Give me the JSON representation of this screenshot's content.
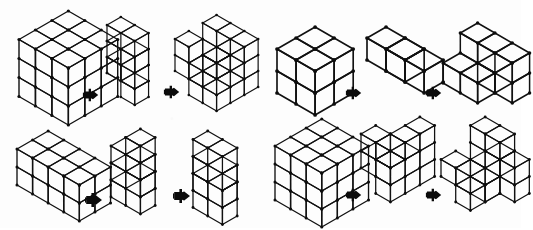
{
  "page": {
    "kind": "line-drawing-worksheet",
    "background_color": "#fdfdfd",
    "ink_color": "#111111",
    "width_px": 521,
    "height_px": 228,
    "layout": "2 rows x 2 columns of problems; each problem shows three isometric cube assemblies separated by two small solid arrow markers",
    "visible_text": ""
  },
  "icons": {
    "arrow_right": "right-arrow-marker",
    "arrow_label": ""
  },
  "problems": [
    {
      "id": "problem-1",
      "position": "top-left",
      "x": 6,
      "y": 4,
      "width": 255,
      "height": 112,
      "stimuli": [
        {
          "id": "p1-s1",
          "role": "whole-cube",
          "name": "solid-3x3x3-cube",
          "dims": [
            3,
            3,
            3
          ],
          "cube_count": 27,
          "x": 16,
          "y": 8,
          "cell": 19,
          "cells": [
            [
              0,
              0,
              0
            ],
            [
              1,
              0,
              0
            ],
            [
              2,
              0,
              0
            ],
            [
              0,
              1,
              0
            ],
            [
              1,
              1,
              0
            ],
            [
              2,
              1,
              0
            ],
            [
              0,
              2,
              0
            ],
            [
              1,
              2,
              0
            ],
            [
              2,
              2,
              0
            ],
            [
              0,
              0,
              1
            ],
            [
              1,
              0,
              1
            ],
            [
              2,
              0,
              1
            ],
            [
              0,
              1,
              1
            ],
            [
              1,
              1,
              1
            ],
            [
              2,
              1,
              1
            ],
            [
              0,
              2,
              1
            ],
            [
              1,
              2,
              1
            ],
            [
              2,
              2,
              1
            ],
            [
              0,
              0,
              2
            ],
            [
              1,
              0,
              2
            ],
            [
              2,
              0,
              2
            ],
            [
              0,
              1,
              2
            ],
            [
              1,
              1,
              2
            ],
            [
              2,
              1,
              2
            ],
            [
              0,
              2,
              2
            ],
            [
              1,
              2,
              2
            ],
            [
              2,
              2,
              2
            ]
          ]
        },
        {
          "id": "p1-s2",
          "role": "piece-a",
          "name": "zigzag-piece",
          "dims": [
            3,
            3,
            2
          ],
          "cube_count": 9,
          "x": 104,
          "y": 14,
          "cell": 16,
          "cells": [
            [
              0,
              2,
              0
            ],
            [
              1,
              2,
              0
            ],
            [
              1,
              2,
              1
            ],
            [
              2,
              2,
              1
            ],
            [
              1,
              1,
              0
            ],
            [
              1,
              1,
              1
            ],
            [
              0,
              0,
              0
            ],
            [
              1,
              0,
              0
            ],
            [
              2,
              0,
              1
            ]
          ]
        },
        {
          "id": "p1-s3",
          "role": "piece-b",
          "name": "notched-block-piece",
          "dims": [
            3,
            3,
            3
          ],
          "cube_count": 18,
          "x": 172,
          "y": 12,
          "cell": 16,
          "cells": [
            [
              0,
              0,
              0
            ],
            [
              1,
              0,
              0
            ],
            [
              2,
              0,
              0
            ],
            [
              0,
              1,
              0
            ],
            [
              2,
              1,
              0
            ],
            [
              0,
              2,
              0
            ],
            [
              1,
              2,
              0
            ],
            [
              2,
              2,
              0
            ],
            [
              0,
              0,
              1
            ],
            [
              2,
              0,
              1
            ],
            [
              1,
              1,
              1
            ],
            [
              2,
              2,
              1
            ],
            [
              1,
              0,
              2
            ],
            [
              2,
              0,
              2
            ],
            [
              0,
              1,
              2
            ],
            [
              2,
              1,
              2
            ],
            [
              0,
              2,
              2
            ],
            [
              2,
              2,
              2
            ]
          ]
        }
      ],
      "arrows": [
        {
          "id": "p1-a1",
          "x": 82,
          "y": 86,
          "size": 18
        },
        {
          "id": "p1-a2",
          "x": 163,
          "y": 83,
          "size": 18
        }
      ]
    },
    {
      "id": "problem-2",
      "position": "top-right",
      "x": 264,
      "y": 12,
      "width": 255,
      "height": 104,
      "stimuli": [
        {
          "id": "p2-s1",
          "role": "whole-cube",
          "name": "solid-2x2x2-block",
          "dims": [
            2,
            2,
            2
          ],
          "cube_count": 8,
          "x": 274,
          "y": 24,
          "cell": 22,
          "cells": [
            [
              0,
              0,
              0
            ],
            [
              1,
              0,
              0
            ],
            [
              0,
              1,
              0
            ],
            [
              1,
              1,
              0
            ],
            [
              0,
              0,
              1
            ],
            [
              1,
              0,
              1
            ],
            [
              0,
              1,
              1
            ],
            [
              1,
              1,
              1
            ]
          ]
        },
        {
          "id": "p2-s2",
          "role": "piece-a",
          "name": "tetromino-t-piece",
          "dims": [
            2,
            2,
            2
          ],
          "cube_count": 4,
          "x": 364,
          "y": 24,
          "cell": 22,
          "cells": [
            [
              0,
              1,
              1
            ],
            [
              0,
              0,
              0
            ],
            [
              1,
              0,
              0
            ],
            [
              1,
              1,
              1
            ]
          ]
        },
        {
          "id": "p2-s3",
          "role": "piece-b",
          "name": "pinwheel-piece",
          "dims": [
            3,
            2,
            2
          ],
          "cube_count": 8,
          "x": 440,
          "y": 20,
          "cell": 20,
          "cells": [
            [
              0,
              1,
              0
            ],
            [
              1,
              1,
              0
            ],
            [
              2,
              1,
              1
            ],
            [
              0,
              0,
              1
            ],
            [
              1,
              0,
              0
            ],
            [
              1,
              0,
              1
            ],
            [
              2,
              0,
              0
            ],
            [
              2,
              1,
              0
            ]
          ]
        }
      ],
      "arrows": [
        {
          "id": "p2-a1",
          "x": 345,
          "y": 84,
          "size": 18
        },
        {
          "id": "p2-a2",
          "x": 425,
          "y": 84,
          "size": 18
        }
      ]
    },
    {
      "id": "problem-3",
      "position": "bottom-left",
      "x": 6,
      "y": 120,
      "width": 255,
      "height": 104,
      "stimuli": [
        {
          "id": "p3-s1",
          "role": "whole-cube",
          "name": "solid-4x2x2-bar",
          "dims": [
            4,
            2,
            2
          ],
          "cube_count": 16,
          "x": 14,
          "y": 128,
          "cell": 18,
          "cells": [
            [
              0,
              0,
              0
            ],
            [
              1,
              0,
              0
            ],
            [
              2,
              0,
              0
            ],
            [
              3,
              0,
              0
            ],
            [
              0,
              1,
              0
            ],
            [
              1,
              1,
              0
            ],
            [
              2,
              1,
              0
            ],
            [
              3,
              1,
              0
            ],
            [
              0,
              0,
              1
            ],
            [
              1,
              0,
              1
            ],
            [
              2,
              0,
              1
            ],
            [
              3,
              0,
              1
            ],
            [
              0,
              1,
              1
            ],
            [
              1,
              1,
              1
            ],
            [
              2,
              1,
              1
            ],
            [
              3,
              1,
              1
            ]
          ]
        },
        {
          "id": "p3-s2",
          "role": "piece-a",
          "name": "staircase-piece",
          "dims": [
            4,
            2,
            3
          ],
          "cube_count": 9,
          "x": 108,
          "y": 126,
          "cell": 17,
          "cells": [
            [
              0,
              0,
              0
            ],
            [
              1,
              0,
              0
            ],
            [
              1,
              1,
              0
            ],
            [
              1,
              0,
              1
            ],
            [
              2,
              0,
              1
            ],
            [
              2,
              1,
              1
            ],
            [
              2,
              0,
              2
            ],
            [
              3,
              0,
              2
            ],
            [
              3,
              1,
              2
            ]
          ]
        },
        {
          "id": "p3-s3",
          "role": "piece-b",
          "name": "stepped-bar-piece",
          "dims": [
            4,
            2,
            3
          ],
          "cube_count": 12,
          "x": 190,
          "y": 128,
          "cell": 17,
          "cells": [
            [
              0,
              0,
              0
            ],
            [
              1,
              0,
              0
            ],
            [
              0,
              1,
              0
            ],
            [
              1,
              1,
              0
            ],
            [
              1,
              0,
              1
            ],
            [
              2,
              0,
              1
            ],
            [
              1,
              1,
              1
            ],
            [
              2,
              1,
              1
            ],
            [
              2,
              0,
              2
            ],
            [
              3,
              0,
              2
            ],
            [
              2,
              1,
              2
            ],
            [
              3,
              1,
              2
            ]
          ]
        }
      ],
      "arrows": [
        {
          "id": "p3-a1",
          "x": 84,
          "y": 190,
          "size": 20
        },
        {
          "id": "p3-a2",
          "x": 172,
          "y": 186,
          "size": 20
        }
      ]
    },
    {
      "id": "problem-4",
      "position": "bottom-right",
      "x": 264,
      "y": 114,
      "width": 255,
      "height": 110,
      "stimuli": [
        {
          "id": "p4-s1",
          "role": "whole-cube",
          "name": "solid-3x3x3-cube",
          "dims": [
            3,
            3,
            3
          ],
          "cube_count": 27,
          "x": 272,
          "y": 116,
          "cell": 18,
          "cells": [
            [
              0,
              0,
              0
            ],
            [
              1,
              0,
              0
            ],
            [
              2,
              0,
              0
            ],
            [
              0,
              1,
              0
            ],
            [
              1,
              1,
              0
            ],
            [
              2,
              1,
              0
            ],
            [
              0,
              2,
              0
            ],
            [
              1,
              2,
              0
            ],
            [
              2,
              2,
              0
            ],
            [
              0,
              0,
              1
            ],
            [
              1,
              0,
              1
            ],
            [
              2,
              0,
              1
            ],
            [
              0,
              1,
              1
            ],
            [
              1,
              1,
              1
            ],
            [
              2,
              1,
              1
            ],
            [
              0,
              2,
              1
            ],
            [
              1,
              2,
              1
            ],
            [
              2,
              2,
              1
            ],
            [
              0,
              0,
              2
            ],
            [
              1,
              0,
              2
            ],
            [
              2,
              0,
              2
            ],
            [
              0,
              1,
              2
            ],
            [
              1,
              1,
              2
            ],
            [
              2,
              1,
              2
            ],
            [
              0,
              2,
              2
            ],
            [
              1,
              2,
              2
            ],
            [
              2,
              2,
              2
            ]
          ]
        },
        {
          "id": "p4-s2",
          "role": "piece-a",
          "name": "corner-step-piece",
          "dims": [
            3,
            3,
            3
          ],
          "cube_count": 13,
          "x": 358,
          "y": 114,
          "cell": 17,
          "cells": [
            [
              0,
              0,
              0
            ],
            [
              1,
              0,
              0
            ],
            [
              2,
              0,
              0
            ],
            [
              2,
              1,
              0
            ],
            [
              2,
              2,
              0
            ],
            [
              1,
              0,
              1
            ],
            [
              2,
              0,
              1
            ],
            [
              2,
              1,
              1
            ],
            [
              2,
              2,
              1
            ],
            [
              0,
              1,
              1
            ],
            [
              1,
              1,
              2
            ],
            [
              2,
              0,
              2
            ],
            [
              2,
              1,
              2
            ]
          ]
        },
        {
          "id": "p4-s3",
          "role": "piece-b",
          "name": "cross-notch-piece",
          "dims": [
            3,
            3,
            3
          ],
          "cube_count": 14,
          "x": 438,
          "y": 114,
          "cell": 17,
          "cells": [
            [
              0,
              2,
              0
            ],
            [
              1,
              2,
              0
            ],
            [
              2,
              2,
              1
            ],
            [
              0,
              1,
              0
            ],
            [
              1,
              1,
              0
            ],
            [
              1,
              1,
              1
            ],
            [
              2,
              1,
              0
            ],
            [
              0,
              0,
              1
            ],
            [
              1,
              0,
              0
            ],
            [
              1,
              0,
              1
            ],
            [
              1,
              0,
              2
            ],
            [
              2,
              0,
              0
            ],
            [
              2,
              1,
              2
            ],
            [
              0,
              1,
              2
            ]
          ]
        }
      ],
      "arrows": [
        {
          "id": "p4-a1",
          "x": 345,
          "y": 186,
          "size": 18
        },
        {
          "id": "p4-a2",
          "x": 425,
          "y": 186,
          "size": 18
        }
      ]
    }
  ]
}
